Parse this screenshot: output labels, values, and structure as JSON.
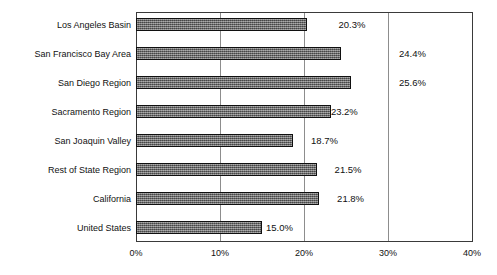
{
  "chart_data": {
    "type": "bar",
    "orientation": "horizontal",
    "title": "",
    "xlabel": "",
    "ylabel": "",
    "xlim": [
      0,
      40
    ],
    "grid": true,
    "legend": "none",
    "xticks": [
      "0%",
      "10%",
      "20%",
      "30%",
      "40%"
    ],
    "xtick_values": [
      0,
      10,
      20,
      30,
      40
    ],
    "categories": [
      "Los Angeles Basin",
      "San Francisco Bay Area",
      "San Diego Region",
      "Sacramento Region",
      "San Joaquin Valley",
      "Rest of State Region",
      "California",
      "United States"
    ],
    "values": [
      20.3,
      24.4,
      25.6,
      23.2,
      18.7,
      21.5,
      21.8,
      15.0
    ],
    "data_labels": [
      "20.3%",
      "24.4%",
      "25.6%",
      "23.2%",
      "18.7%",
      "21.5%",
      "21.8%",
      "15.0%"
    ],
    "label_offsets_px": [
      32,
      58,
      48,
      0,
      18,
      18,
      18,
      4
    ],
    "colors": {
      "bar_fill": "#6f6f6f",
      "bar_border": "#101010",
      "frame": "#3a3a3a",
      "gridline": "#8d8d8d",
      "text": "#111111",
      "background": "#ffffff"
    }
  }
}
